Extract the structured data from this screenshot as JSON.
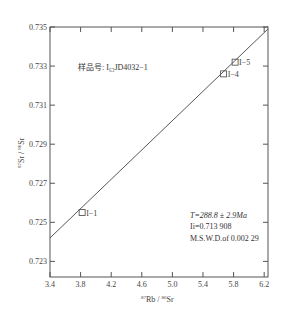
{
  "chart_data": {
    "type": "scatter",
    "title": "",
    "xlabel": "87Rb / 86Sr",
    "ylabel": "87Sr / 86Sr",
    "xlim": [
      3.4,
      6.25
    ],
    "ylim": [
      0.7222,
      0.735
    ],
    "x_ticks": [
      "3.4",
      "3.8",
      "4.2",
      "4.6",
      "5.0",
      "5.4",
      "5.8",
      "6.2"
    ],
    "y_ticks": [
      "0.723",
      "0.725",
      "0.727",
      "0.729",
      "0.731",
      "0.733",
      "0.735"
    ],
    "grid": false,
    "legend": null,
    "points": [
      {
        "label": "I−1",
        "x": 3.82,
        "y": 0.7255
      },
      {
        "label": "I−4",
        "x": 5.67,
        "y": 0.7326
      },
      {
        "label": "I−5",
        "x": 5.82,
        "y": 0.7332
      }
    ],
    "isochron_line": {
      "x": [
        3.4,
        6.25
      ],
      "y": [
        0.7242,
        0.7349
      ]
    },
    "annotations": {
      "sample": "样品号: I₆₃JD4032−1",
      "age": "T=288.8 ± 2.9Ma",
      "initial_ratio": "Ii=0.713 908",
      "mswd": "M.S.W.D.of   0.002 29"
    }
  },
  "labels": {
    "x_axis_sup1": "87",
    "x_axis_main1": "Rb",
    "x_axis_sep": " / ",
    "x_axis_sup2": "86",
    "x_axis_main2": "Sr",
    "y_axis_sup1": "87",
    "y_axis_main1": "Sr",
    "y_axis_sep": " / ",
    "y_axis_sup2": "86",
    "y_axis_main2": "Sr"
  }
}
